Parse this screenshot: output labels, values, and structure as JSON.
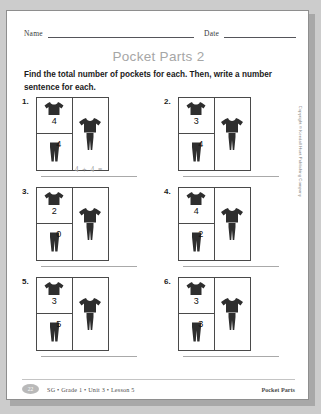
{
  "header": {
    "name_label": "Name",
    "date_label": "Date"
  },
  "title": "Pocket Parts 2",
  "instructions": "Find the total number of pockets for each. Then, write a number sentence for each.",
  "problems": [
    {
      "number": "1.",
      "shirt_value": "4",
      "pants_value": "4",
      "answer": "4 + 4 ="
    },
    {
      "number": "2.",
      "shirt_value": "3",
      "pants_value": "4",
      "answer": ""
    },
    {
      "number": "3.",
      "shirt_value": "2",
      "pants_value": "0",
      "answer": ""
    },
    {
      "number": "4.",
      "shirt_value": "4",
      "pants_value": "2",
      "answer": ""
    },
    {
      "number": "5.",
      "shirt_value": "3",
      "pants_value": "5",
      "answer": ""
    },
    {
      "number": "6.",
      "shirt_value": "3",
      "pants_value": "3",
      "answer": ""
    }
  ],
  "copyright": "Copyright © Kendall Hunt Publishing Company",
  "footer": {
    "page_number": "22",
    "breadcrumb": "SG • Grade 1 • Unit 3 • Lesson 5",
    "title": "Pocket Parts"
  },
  "colors": {
    "title_gray": "#a6a6a6",
    "garment": "#2e2e2e",
    "rule": "#55555a",
    "page_bg": "#ffffff",
    "backdrop": "#cccccc"
  }
}
